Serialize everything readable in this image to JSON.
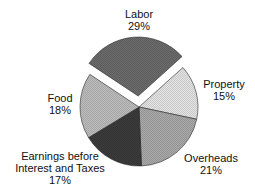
{
  "chart_data": {
    "type": "pie",
    "title": "",
    "exploded": [
      "Labor"
    ],
    "slices": [
      {
        "name": "Labor",
        "value": 29,
        "label": "Labor",
        "pct_label": "29%",
        "color": "#6b6b6b",
        "exploded": true
      },
      {
        "name": "Property",
        "value": 15,
        "label": "Property",
        "pct_label": "15%",
        "color": "#e4e4e4",
        "exploded": false
      },
      {
        "name": "Overheads",
        "value": 21,
        "label": "Overheads",
        "pct_label": "21%",
        "color": "#a9a9a9",
        "exploded": false
      },
      {
        "name": "Earnings before Interest and Taxes",
        "value": 17,
        "label": "Earnings before\nInterest and Taxes",
        "pct_label": "17%",
        "color": "#3b3b3b",
        "exploded": false
      },
      {
        "name": "Food",
        "value": 18,
        "label": "Food",
        "pct_label": "18%",
        "color": "#bdbdbd",
        "exploded": false
      }
    ],
    "categories": [
      "Labor",
      "Property",
      "Overheads",
      "Earnings before Interest and Taxes",
      "Food"
    ],
    "values": [
      29,
      15,
      21,
      17,
      18
    ],
    "legend": "none (inline labels)"
  },
  "labels": {
    "labor": {
      "name": "Labor",
      "pct": "29%"
    },
    "property": {
      "name": "Property",
      "pct": "15%"
    },
    "overheads": {
      "name": "Overheads",
      "pct": "21%"
    },
    "ebit": {
      "line1": "Earnings before",
      "line2": "Interest and Taxes",
      "pct": "17%"
    },
    "food": {
      "name": "Food",
      "pct": "18%"
    }
  }
}
